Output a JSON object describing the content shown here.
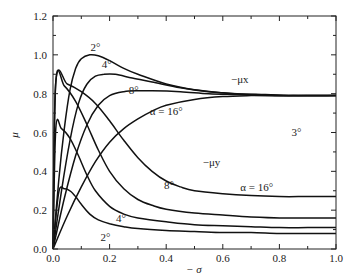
{
  "chart_data": {
    "type": "line",
    "title": "",
    "xlabel": "− σ",
    "ylabel": "μ",
    "xlim": [
      0,
      1.0
    ],
    "ylim": [
      0,
      1.2
    ],
    "grid": false,
    "legend": "none (inline annotations)",
    "x_ticks": [
      "0.0",
      "0.2",
      "0.4",
      "0.6",
      "0.8",
      "1.0"
    ],
    "y_ticks": [
      "0.0",
      "0.2",
      "0.4",
      "0.6",
      "0.8",
      "1.0",
      "1.2"
    ],
    "series": [
      {
        "name": "-μx, α=2°",
        "group": "mu_x",
        "alpha": 2,
        "x": [
          0,
          0.02,
          0.04,
          0.06,
          0.08,
          0.1,
          0.13,
          0.16,
          0.2,
          0.25,
          0.3,
          0.4,
          0.5,
          0.6,
          0.7,
          0.8,
          0.9,
          1.0
        ],
        "y": [
          0,
          0.35,
          0.62,
          0.82,
          0.93,
          0.98,
          1.0,
          0.995,
          0.97,
          0.93,
          0.9,
          0.85,
          0.82,
          0.805,
          0.795,
          0.79,
          0.79,
          0.79
        ]
      },
      {
        "name": "-μx, α=4°",
        "group": "mu_x",
        "alpha": 4,
        "x": [
          0,
          0.03,
          0.06,
          0.09,
          0.12,
          0.15,
          0.18,
          0.22,
          0.28,
          0.35,
          0.45,
          0.55,
          0.65,
          0.75,
          0.85,
          1.0
        ],
        "y": [
          0,
          0.3,
          0.56,
          0.75,
          0.85,
          0.89,
          0.9,
          0.9,
          0.88,
          0.86,
          0.83,
          0.81,
          0.8,
          0.795,
          0.79,
          0.79
        ]
      },
      {
        "name": "-μx, α=8°",
        "group": "mu_x",
        "alpha": 8,
        "x": [
          0,
          0.04,
          0.08,
          0.12,
          0.16,
          0.2,
          0.25,
          0.3,
          0.35,
          0.45,
          0.55,
          0.65,
          0.75,
          0.85,
          1.0
        ],
        "y": [
          0,
          0.26,
          0.48,
          0.64,
          0.74,
          0.79,
          0.81,
          0.815,
          0.815,
          0.81,
          0.8,
          0.795,
          0.79,
          0.79,
          0.79
        ]
      },
      {
        "name": "-μx, α=16°",
        "group": "mu_x",
        "alpha": 16,
        "x": [
          0,
          0.05,
          0.1,
          0.15,
          0.2,
          0.25,
          0.3,
          0.35,
          0.4,
          0.5,
          0.6,
          0.7,
          0.8,
          0.9,
          1.0
        ],
        "y": [
          0,
          0.17,
          0.32,
          0.45,
          0.55,
          0.62,
          0.67,
          0.71,
          0.74,
          0.77,
          0.785,
          0.79,
          0.79,
          0.79,
          0.79
        ]
      },
      {
        "name": "-μy, α=2°",
        "group": "mu_y",
        "alpha": 2,
        "x": [
          0,
          0.02,
          0.04,
          0.06,
          0.08,
          0.1,
          0.13,
          0.16,
          0.2,
          0.25,
          0.3,
          0.4,
          0.5,
          0.6,
          0.7,
          0.8,
          0.9,
          1.0
        ],
        "y": [
          0,
          0.29,
          0.31,
          0.3,
          0.27,
          0.23,
          0.18,
          0.15,
          0.13,
          0.115,
          0.105,
          0.095,
          0.09,
          0.085,
          0.085,
          0.08,
          0.08,
          0.08
        ]
      },
      {
        "name": "-μy, α=4°",
        "group": "mu_y",
        "alpha": 4,
        "x": [
          0,
          0.01,
          0.03,
          0.06,
          0.09,
          0.12,
          0.15,
          0.2,
          0.25,
          0.3,
          0.4,
          0.5,
          0.6,
          0.7,
          0.8,
          0.9,
          1.0
        ],
        "y": [
          0,
          0.62,
          0.62,
          0.57,
          0.48,
          0.38,
          0.3,
          0.22,
          0.18,
          0.16,
          0.14,
          0.125,
          0.12,
          0.115,
          0.11,
          0.11,
          0.11
        ]
      },
      {
        "name": "-μy, α=8°",
        "group": "mu_y",
        "alpha": 8,
        "x": [
          0,
          0.01,
          0.04,
          0.08,
          0.12,
          0.16,
          0.2,
          0.25,
          0.3,
          0.35,
          0.4,
          0.5,
          0.6,
          0.7,
          0.8,
          0.9,
          1.0
        ],
        "y": [
          0,
          0.86,
          0.84,
          0.76,
          0.64,
          0.51,
          0.4,
          0.31,
          0.255,
          0.225,
          0.205,
          0.185,
          0.175,
          0.165,
          0.16,
          0.16,
          0.16
        ]
      },
      {
        "name": "-μy, α=16°",
        "group": "mu_y",
        "alpha": 16,
        "x": [
          0,
          0.01,
          0.05,
          0.1,
          0.15,
          0.2,
          0.25,
          0.3,
          0.35,
          0.4,
          0.45,
          0.5,
          0.6,
          0.7,
          0.8,
          0.9,
          1.0
        ],
        "y": [
          0,
          0.86,
          0.85,
          0.81,
          0.75,
          0.66,
          0.56,
          0.47,
          0.4,
          0.35,
          0.32,
          0.3,
          0.285,
          0.275,
          0.27,
          0.27,
          0.27
        ]
      }
    ],
    "annotations": [
      {
        "text": "2°",
        "x": 0.15,
        "y": 1.02
      },
      {
        "text": "4°",
        "x": 0.19,
        "y": 0.93
      },
      {
        "text": "8°",
        "x": 0.285,
        "y": 0.8
      },
      {
        "text": "α = 16°",
        "x": 0.4,
        "y": 0.69
      },
      {
        "text": "−μx",
        "x": 0.66,
        "y": 0.855
      },
      {
        "text": "3°",
        "x": 0.86,
        "y": 0.58
      },
      {
        "text": "−μy",
        "x": 0.56,
        "y": 0.43
      },
      {
        "text": "8°",
        "x": 0.41,
        "y": 0.31
      },
      {
        "text": "α = 16°",
        "x": 0.72,
        "y": 0.3
      },
      {
        "text": "4°",
        "x": 0.24,
        "y": 0.14
      },
      {
        "text": "2°",
        "x": 0.185,
        "y": 0.04
      }
    ]
  }
}
